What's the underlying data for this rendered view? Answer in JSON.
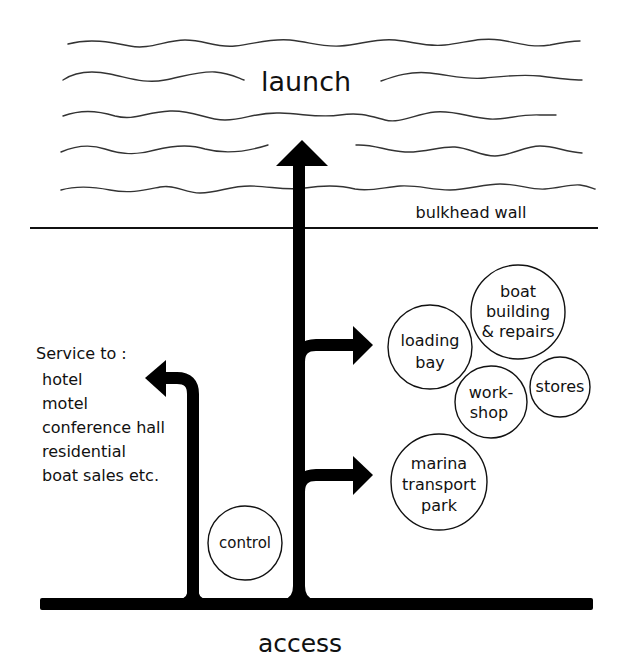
{
  "diagram": {
    "title_water": "launch",
    "bulkhead_label": "bulkhead wall",
    "access_label": "access",
    "service": {
      "heading": "Service to :",
      "items": [
        "hotel",
        "motel",
        "conference hall",
        "residential",
        "boat sales etc."
      ]
    },
    "nodes": {
      "loading_bay": [
        "loading",
        "bay"
      ],
      "boat_building": [
        "boat",
        "building",
        "& repairs"
      ],
      "workshop": [
        "work-",
        "shop"
      ],
      "stores": [
        "stores"
      ],
      "marina": [
        "marina",
        "transport",
        "park"
      ],
      "control": [
        "control"
      ]
    },
    "colors": {
      "ink": "#000000",
      "background": "#ffffff",
      "wave": "#333333"
    }
  }
}
